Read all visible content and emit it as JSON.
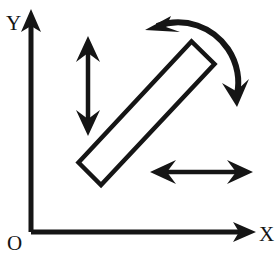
{
  "figure": {
    "background_color": "#ffffff",
    "ink_color": "#151515",
    "width": 275,
    "height": 258
  },
  "axes": {
    "origin_label": "O",
    "x_label": "X",
    "y_label": "Y",
    "origin_point": [
      31,
      232
    ],
    "x_axis_end": [
      258,
      232
    ],
    "y_axis_end": [
      31,
      12
    ],
    "stroke_width": 5
  },
  "rod": {
    "name": "rod",
    "shape": "rectangle",
    "angle_deg": -40,
    "center": [
      146,
      113
    ],
    "length": 176,
    "thickness": 31,
    "stroke_width": 4.5,
    "fill": "none"
  },
  "arrows": {
    "vertical_double": {
      "label": "vertical translation",
      "x": 88,
      "y_top": 38,
      "y_bottom": 134,
      "heads": "both",
      "stroke_width": 4.5
    },
    "horizontal_double": {
      "label": "horizontal translation",
      "y": 172,
      "x_left": 152,
      "x_right": 251,
      "heads": "both",
      "stroke_width": 4.5
    },
    "rotation_curved": {
      "label": "rotation",
      "heads": "both",
      "start_point": [
        150,
        27
      ],
      "end_point": [
        237,
        104
      ],
      "stroke_width": 6
    }
  }
}
